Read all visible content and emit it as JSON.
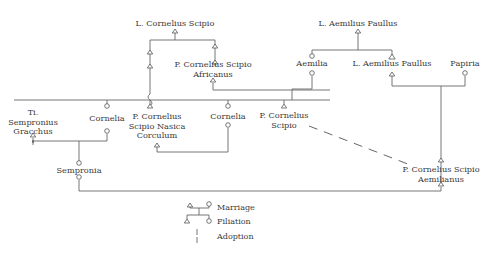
{
  "people": {
    "l_cornelius_scipio": "L. Cornelius Scipio",
    "l_aemilius_paullus_sr": "L. Aemilius Paullus",
    "scipio_africanus": "P. Cornelius Scipio\nAfricanus",
    "aemilia": "Aemilia",
    "l_aemilius_paullus_jr": "L. Aemilius Paullus",
    "papiria": "Papiria",
    "ti_sempronius_gracchus": "Ti.\nSempronius\nGracchus",
    "cornelia_elder": "Cornelia",
    "scipio_nasica_corculum": "P. Cornelius\nScipio Nasica\nCorculum",
    "cornelia_younger": "Cornelia",
    "p_cornelius_scipio": "P. Cornelius\nScipio",
    "sempronia": "Sempronia",
    "scipio_aemilianus": "P. Cornelius Scipio\nAemilianus"
  },
  "legend": {
    "items": [
      {
        "symbol": "marriage-line",
        "label": "Marriage"
      },
      {
        "symbol": "filiation-line",
        "label": "Filiation"
      },
      {
        "symbol": "adoption-line",
        "label": "Adoption"
      }
    ]
  },
  "symbols": {
    "male": "triangle",
    "female": "circle"
  }
}
